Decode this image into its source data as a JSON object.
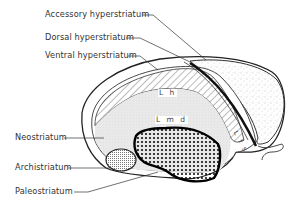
{
  "figure": {
    "labels": {
      "accessory_hyperstriatum": "Accessory hyperstriatum",
      "dorsal_hyperstriatum": "Dorsal hyperstriatum",
      "ventral_hyperstriatum": "Ventral hyperstriatum",
      "neostriatum": "Neostriatum",
      "archistriatum": "Archistriatum",
      "paleostriatum": "Paleostriatum"
    },
    "region_marks": {
      "lh": "L h",
      "lmd": "L m d",
      "lfs": "L f s"
    },
    "colors": {
      "ink": "#222222",
      "background": "#ffffff",
      "stipple": "#d9d9d9"
    }
  }
}
